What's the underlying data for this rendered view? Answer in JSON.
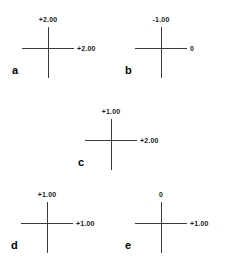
{
  "figure": {
    "kind": "optical-cross-diagram",
    "background_color": "#ffffff",
    "line_color": "#3a3a3a",
    "text_color": "#1a1a1a",
    "panels": [
      {
        "letter": "a",
        "vertical_power": "+2.00",
        "horizontal_power": "+2.00",
        "center_x": 48,
        "center_y": 48,
        "letter_x": 12,
        "letter_y": 65
      },
      {
        "letter": "b",
        "vertical_power": "-1.00",
        "horizontal_power": "0",
        "center_x": 161,
        "center_y": 48,
        "letter_x": 125,
        "letter_y": 65
      },
      {
        "letter": "c",
        "vertical_power": "+1.00",
        "horizontal_power": "+2.00",
        "center_x": 111,
        "center_y": 140,
        "letter_x": 78,
        "letter_y": 157
      },
      {
        "letter": "d",
        "vertical_power": "+1.00",
        "horizontal_power": "+1.00",
        "center_x": 47,
        "center_y": 223,
        "letter_x": 11,
        "letter_y": 240
      },
      {
        "letter": "e",
        "vertical_power": "0",
        "horizontal_power": "+1.00",
        "center_x": 161,
        "center_y": 223,
        "letter_x": 125,
        "letter_y": 240
      }
    ]
  }
}
